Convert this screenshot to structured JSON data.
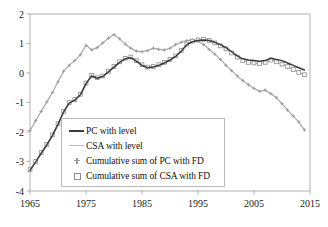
{
  "chart_data": {
    "type": "line",
    "title": "",
    "subtitle": "",
    "xlabel": "",
    "ylabel": "",
    "xlim": [
      1965,
      2015
    ],
    "ylim": [
      -4,
      2
    ],
    "grid": false,
    "legend_position": "inside-bottom-left",
    "x_ticks": [
      "1965",
      "1975",
      "1985",
      "1995",
      "2005",
      "2015"
    ],
    "x_tick_values": [
      1965,
      1975,
      1985,
      1995,
      2005,
      2015
    ],
    "y_ticks": [
      "2",
      "1",
      "0",
      "-1",
      "-2",
      "-3",
      "-4"
    ],
    "y_tick_values": [
      2,
      1,
      0,
      -1,
      -2,
      -3,
      -4
    ],
    "x": [
      1965,
      1966,
      1967,
      1968,
      1969,
      1970,
      1971,
      1972,
      1973,
      1974,
      1975,
      1976,
      1977,
      1978,
      1979,
      1980,
      1981,
      1982,
      1983,
      1984,
      1985,
      1986,
      1987,
      1988,
      1989,
      1990,
      1991,
      1992,
      1993,
      1994,
      1995,
      1996,
      1997,
      1998,
      1999,
      2000,
      2001,
      2002,
      2003,
      2004,
      2005,
      2006,
      2007,
      2008,
      2009,
      2010,
      2011,
      2012,
      2013,
      2014
    ],
    "series": [
      {
        "name": "PC with level",
        "marker": "none",
        "line": "solid",
        "color": "#3a3a3a",
        "values": [
          -3.3,
          -3.02,
          -2.72,
          -2.44,
          -2.12,
          -1.74,
          -1.32,
          -1.02,
          -0.92,
          -0.74,
          -0.36,
          -0.1,
          -0.18,
          -0.12,
          0.04,
          0.2,
          0.36,
          0.48,
          0.52,
          0.4,
          0.26,
          0.18,
          0.2,
          0.26,
          0.34,
          0.44,
          0.56,
          0.74,
          0.96,
          1.06,
          1.1,
          1.12,
          1.1,
          1.04,
          0.96,
          0.86,
          0.72,
          0.58,
          0.48,
          0.44,
          0.42,
          0.4,
          0.42,
          0.5,
          0.46,
          0.42,
          0.34,
          0.26,
          0.18,
          0.1
        ]
      },
      {
        "name": "CSA with level",
        "marker": "none",
        "line": "solid",
        "color": "#c2c2c2",
        "values": [
          -1.95,
          -1.62,
          -1.3,
          -0.98,
          -0.66,
          -0.3,
          0.06,
          0.26,
          0.42,
          0.62,
          0.94,
          0.78,
          0.86,
          1.02,
          1.18,
          1.3,
          1.16,
          0.98,
          0.84,
          0.74,
          0.72,
          0.76,
          0.84,
          0.8,
          0.78,
          0.84,
          0.96,
          1.04,
          1.1,
          1.12,
          1.08,
          0.96,
          0.8,
          0.64,
          0.46,
          0.26,
          0.08,
          -0.1,
          -0.26,
          -0.4,
          -0.52,
          -0.62,
          -0.58,
          -0.7,
          -0.84,
          -1.04,
          -1.26,
          -1.46,
          -1.66,
          -1.93
        ]
      },
      {
        "name": "Cumulative sum of PC with FD",
        "marker": "plus",
        "line": "solid",
        "color": "#9a9a9a",
        "values": [
          -1.95,
          -1.62,
          -1.3,
          -0.98,
          -0.66,
          -0.3,
          0.06,
          0.26,
          0.42,
          0.62,
          0.94,
          0.78,
          0.86,
          1.02,
          1.18,
          1.3,
          1.16,
          0.98,
          0.84,
          0.74,
          0.72,
          0.76,
          0.84,
          0.8,
          0.78,
          0.84,
          0.96,
          1.04,
          1.1,
          1.12,
          1.08,
          0.96,
          0.8,
          0.64,
          0.46,
          0.26,
          0.08,
          -0.1,
          -0.26,
          -0.4,
          -0.52,
          -0.62,
          -0.58,
          -0.7,
          -0.84,
          -1.04,
          -1.26,
          -1.46,
          -1.66,
          -1.93
        ]
      },
      {
        "name": "Cumulative sum of CSA with FD",
        "marker": "square",
        "line": "solid",
        "color": "#8d8d8d",
        "values": [
          -3.28,
          -3.0,
          -2.7,
          -2.42,
          -2.1,
          -1.72,
          -1.3,
          -1.0,
          -0.9,
          -0.72,
          -0.34,
          -0.08,
          -0.16,
          -0.1,
          0.06,
          0.22,
          0.38,
          0.5,
          0.54,
          0.42,
          0.28,
          0.2,
          0.22,
          0.28,
          0.36,
          0.46,
          0.58,
          0.76,
          0.98,
          1.08,
          1.12,
          1.14,
          1.1,
          1.02,
          0.92,
          0.82,
          0.68,
          0.54,
          0.42,
          0.36,
          0.34,
          0.32,
          0.36,
          0.44,
          0.38,
          0.3,
          0.22,
          0.12,
          0.02,
          -0.06
        ]
      }
    ]
  },
  "legend": {
    "items": [
      {
        "label": "PC with level",
        "marker": "solid-line"
      },
      {
        "label": "CSA with level",
        "marker": "gray-line"
      },
      {
        "label": "Cumulative sum of PC with FD",
        "marker": "plus-marker"
      },
      {
        "label": "Cumulative sum of CSA with FD",
        "marker": "open-square-marker"
      }
    ]
  },
  "axes": {
    "frame_color": "#a8a8a8",
    "tick_color": "#a8a8a8"
  }
}
